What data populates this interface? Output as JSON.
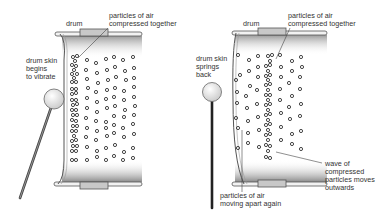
{
  "diagram": {
    "panels": [
      {
        "id": "left",
        "labels": {
          "drum": "drum",
          "compressed_line1": "particles of air",
          "compressed_line2": "compressed together",
          "skin_line1": "drum skin",
          "skin_line2": "begins",
          "skin_line3": "to vibrate"
        }
      },
      {
        "id": "right",
        "labels": {
          "drum": "drum",
          "compressed_line1": "particles of air",
          "compressed_line2": "compressed together",
          "skin_line1": "drum skin",
          "skin_line2": "springs",
          "skin_line3": "back",
          "wave_line1": "wave of",
          "wave_line2": "compressed",
          "wave_line3": "particles moves",
          "wave_line4": "outwards",
          "apart_line1": "particles of air",
          "apart_line2": "moving apart again"
        }
      }
    ],
    "colors": {
      "outline": "#555555",
      "particle": "#333333",
      "shade": "#888888",
      "label": "#333333"
    }
  }
}
